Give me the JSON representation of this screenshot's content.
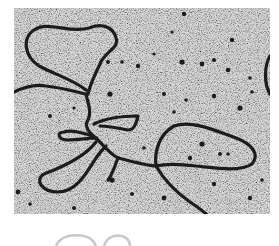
{
  "image": {
    "kind": "electron micrograph",
    "subject": "DNA strands with loops",
    "colors": {
      "background": "#ffffff",
      "field": "#b8b8b8",
      "strand": "#1e1e1e",
      "arc": "#c8c8c8"
    }
  }
}
